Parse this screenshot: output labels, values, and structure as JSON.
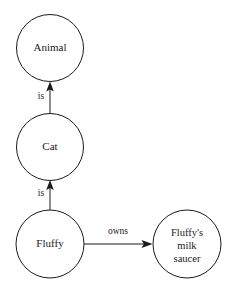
{
  "diagram": {
    "type": "semantic-network",
    "background_color": "#ffffff",
    "stroke_color": "#1a1a1a",
    "node_fill_color": "#ffffff",
    "nodes": [
      {
        "id": "animal",
        "label": "Animal",
        "lines": [
          "Animal"
        ],
        "cx": 50,
        "cy": 48,
        "r": 33.5
      },
      {
        "id": "cat",
        "label": "Cat",
        "lines": [
          "Cat"
        ],
        "cx": 50,
        "cy": 147,
        "r": 33.5
      },
      {
        "id": "fluffy",
        "label": "Fluffy",
        "lines": [
          "Fluffy"
        ],
        "cx": 50,
        "cy": 244,
        "r": 34
      },
      {
        "id": "saucer",
        "label": "Fluffy's milk saucer",
        "lines": [
          "Fluffy's",
          "milk",
          "saucer"
        ],
        "line1": "Fluffy's",
        "line2": "milk",
        "line3": "saucer",
        "cx": 187,
        "cy": 244,
        "r": 34
      }
    ],
    "edges": [
      {
        "id": "cat-is-animal",
        "label": "is",
        "from": "cat",
        "to": "animal",
        "direction": "up",
        "label_x": 41,
        "label_y": 97
      },
      {
        "id": "fluffy-is-cat",
        "label": "is",
        "from": "fluffy",
        "to": "cat",
        "direction": "up",
        "label_x": 41,
        "label_y": 194
      },
      {
        "id": "fluffy-owns-saucer",
        "label": "owns",
        "from": "fluffy",
        "to": "saucer",
        "direction": "right",
        "label_x": 118,
        "label_y": 232
      }
    ]
  }
}
